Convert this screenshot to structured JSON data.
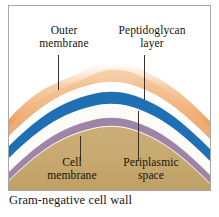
{
  "figure": {
    "caption": "Gram-negative cell wall"
  },
  "labels": {
    "outer_membrane": {
      "line1": "Outer",
      "line2": "membrane"
    },
    "peptidoglycan": {
      "line1": "Peptidoglycan",
      "line2": "layer"
    },
    "cell_membrane": {
      "line1": "Cell",
      "line2": "membrane"
    },
    "periplasmic_space": {
      "line1": "Periplasmic",
      "line2": "space"
    }
  },
  "colors": {
    "outer_membrane": "#E8913F",
    "outer_membrane_light": "#F6C48E",
    "peptidoglycan": "#1F6FB5",
    "periplasm_gap": "#FFFFFF",
    "cell_membrane": "#9E85A8",
    "cytoplasm": "#C6A86F",
    "frame": "#A8A8A8",
    "text": "#18120C",
    "leader_line": "#3A3028",
    "background": "#FFFFFF"
  },
  "diagram": {
    "type": "cross-section",
    "structure_order": [
      "Outer membrane",
      "Periplasmic space",
      "Peptidoglycan layer",
      "Periplasmic space",
      "Cell membrane",
      "Cytoplasm"
    ]
  }
}
